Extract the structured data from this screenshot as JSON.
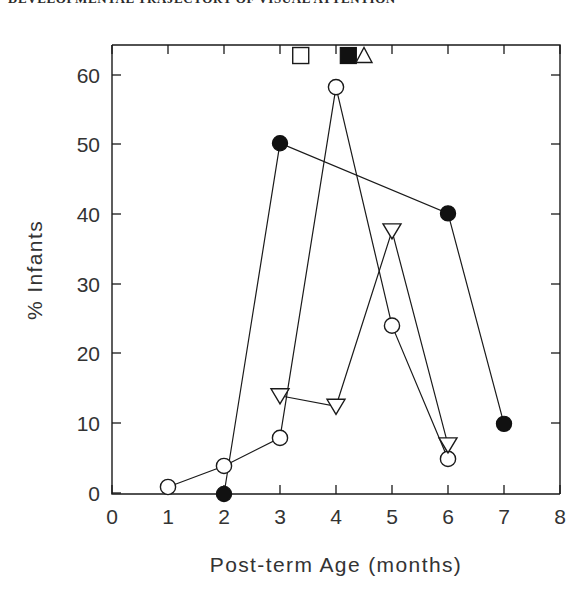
{
  "header": {
    "running_title": "DEVELOPMENTAL TRAJECTORY OF VISUAL ATTENTION",
    "visible": "partially cropped at top edge"
  },
  "chart_data": {
    "type": "line",
    "title": "",
    "xlabel": "Post-term Age (months)",
    "ylabel": "% Infants",
    "xlim": [
      0,
      8
    ],
    "ylim": [
      0,
      64
    ],
    "xticks": [
      0,
      1,
      2,
      3,
      4,
      5,
      6,
      7,
      8
    ],
    "xticklabels": [
      "0",
      "1",
      "2",
      "3",
      "4",
      "5",
      "6",
      "7",
      "8"
    ],
    "yticks": [
      0,
      10,
      20,
      30,
      40,
      50,
      60
    ],
    "yticklabels": [
      "0",
      "10",
      "20",
      "30",
      "40",
      "50",
      "60"
    ],
    "grid": false,
    "legend_position": "none",
    "series": [
      {
        "name": "filled-circle-series",
        "marker": "filled-circle",
        "x": [
          2,
          3,
          6,
          7
        ],
        "y": [
          0,
          50,
          40,
          10
        ]
      },
      {
        "name": "open-circle-series",
        "marker": "open-circle",
        "x": [
          1,
          2,
          3,
          4,
          5,
          6
        ],
        "y": [
          1,
          4,
          8,
          58,
          24,
          5
        ]
      },
      {
        "name": "open-triangle-series",
        "marker": "open-down-triangle",
        "x": [
          3,
          4,
          5,
          6
        ],
        "y": [
          14,
          12.5,
          37.5,
          7
        ]
      }
    ],
    "annotations": [
      {
        "name": "open-square-marker",
        "marker": "open-square",
        "x": 3.37,
        "y": 62.5
      },
      {
        "name": "filled-square-marker",
        "marker": "filled-square",
        "x": 4.22,
        "y": 62.5
      },
      {
        "name": "open-triangle-marker",
        "marker": "open-up-triangle",
        "x": 4.5,
        "y": 62.5
      }
    ]
  },
  "axes": {
    "x_title": "Post-term Age (months)",
    "y_title": "% Infants"
  }
}
